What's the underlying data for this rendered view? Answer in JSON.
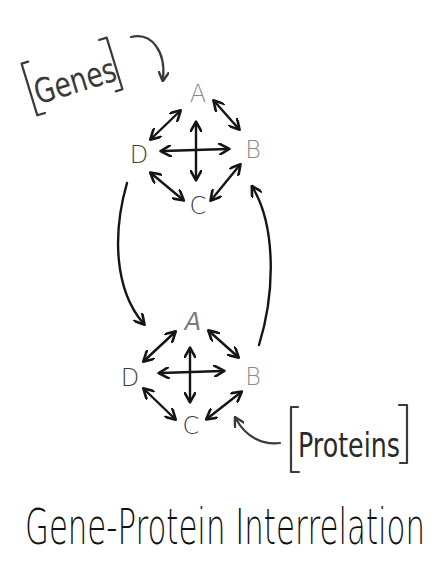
{
  "diagram": {
    "title": "Gene-Protein Interrelation",
    "colors": {
      "ink": "#151515",
      "node_light": "#8a8a8a",
      "node_dark": "#3c3c3c",
      "label": "#3a3a3a",
      "background": "#ffffff"
    },
    "labels": {
      "genes": "Genes",
      "proteins": "Proteins"
    },
    "networks": [
      {
        "name": "genes-network",
        "nodes": [
          {
            "id": "A",
            "label": "A"
          },
          {
            "id": "B",
            "label": "B"
          },
          {
            "id": "C",
            "label": "C"
          },
          {
            "id": "D",
            "label": "D"
          }
        ],
        "edges": [
          [
            "A",
            "B"
          ],
          [
            "B",
            "C"
          ],
          [
            "C",
            "D"
          ],
          [
            "D",
            "A"
          ],
          [
            "A",
            "C"
          ],
          [
            "D",
            "B"
          ]
        ],
        "edge_style": "bidirectional"
      },
      {
        "name": "proteins-network",
        "nodes": [
          {
            "id": "A",
            "label": "A"
          },
          {
            "id": "B",
            "label": "B"
          },
          {
            "id": "C",
            "label": "C"
          },
          {
            "id": "D",
            "label": "D"
          }
        ],
        "edges": [
          [
            "A",
            "B"
          ],
          [
            "B",
            "C"
          ],
          [
            "C",
            "D"
          ],
          [
            "D",
            "A"
          ],
          [
            "A",
            "C"
          ],
          [
            "D",
            "B"
          ]
        ],
        "edge_style": "bidirectional"
      }
    ],
    "connections": [
      {
        "from": "genes-network.D",
        "to": "proteins-network.A"
      },
      {
        "from": "proteins-network.B",
        "to": "genes-network.B"
      }
    ]
  }
}
